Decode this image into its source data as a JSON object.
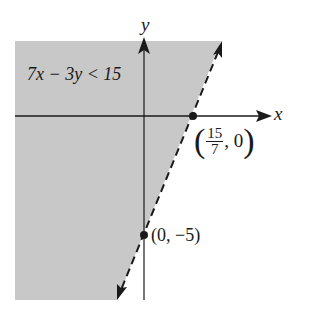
{
  "diagram": {
    "type": "linear-inequality-graph",
    "inequality": "7x − 3y < 15",
    "axes": {
      "x_label": "x",
      "y_label": "y"
    },
    "boundary_line": {
      "style": "dashed",
      "equation": "7x − 3y = 15"
    },
    "shaded_side": "left/above boundary",
    "points": [
      {
        "label_num": "15",
        "label_den": "7",
        "label_rest": ", 0",
        "coords": "(15/7, 0)"
      },
      {
        "label": "(0, −5)",
        "coords": "(0, −5)"
      }
    ],
    "colors": {
      "shade": "#c8c8c8",
      "ink": "#1a1a1a"
    }
  }
}
